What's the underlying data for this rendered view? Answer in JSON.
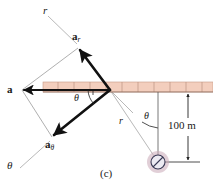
{
  "figure": {
    "caption": "(c)",
    "type": "vector-diagram-polar-acceleration-components",
    "colors": {
      "beam_fill": "#f3cebd",
      "beam_stroke": "#b08b7a",
      "vector_stroke": "#111111",
      "construction_stroke": "#8c8c8c",
      "dimension_stroke": "#222222",
      "ball_glow": "#c9a7b6",
      "ball_fill": "#e8e4ee",
      "ball_stroke": "#3a3a55",
      "background": "#ffffff"
    },
    "labels": {
      "r_axis_upper": "r",
      "a_r_base": "a",
      "a_r_sub": "r",
      "a_total": "a",
      "a_theta_base": "a",
      "a_theta_sub": "θ",
      "theta_axis_lower": "θ",
      "theta_angle_left": "θ",
      "theta_angle_right": "θ",
      "r_radial_line": "r",
      "distance": "100 m"
    },
    "geometry": {
      "origin_x": 110,
      "origin_y": 90,
      "beam_left": 43,
      "beam_right": 213,
      "beam_top": 82,
      "beam_bottom": 92,
      "beam_tick_count": 11,
      "ball_center_x": 158,
      "ball_center_y": 162,
      "ball_radius": 7,
      "dimension_x": 188,
      "dimension_top_y": 92,
      "dimension_bottom_y": 162
    }
  }
}
